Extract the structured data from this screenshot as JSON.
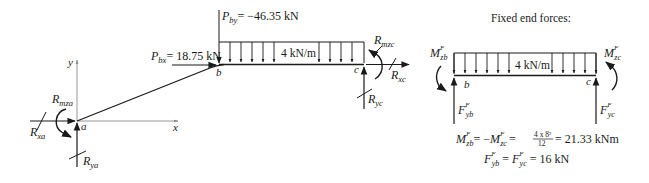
{
  "colors": {
    "ink": "#1a1a1a",
    "axis": "#8a8a8a",
    "background": "#ffffff"
  },
  "left_diagram": {
    "axis_labels": {
      "y": "y",
      "x": "x"
    },
    "nodes": {
      "a": "a",
      "b": "b",
      "c": "c"
    },
    "loads": {
      "pbx": {
        "symbol": "P",
        "sub": "bx",
        "value": "= 18.75 kN"
      },
      "pby": {
        "symbol": "P",
        "sub": "by",
        "value": "= −46.35 kN"
      },
      "udl": "4 kN/m"
    },
    "reactions": {
      "rmza": {
        "symbol": "R",
        "sub": "mza"
      },
      "rxa": {
        "symbol": "R",
        "sub": "xa"
      },
      "rya": {
        "symbol": "R",
        "sub": "ya"
      },
      "rmzc": {
        "symbol": "R",
        "sub": "mzc"
      },
      "rxc": {
        "symbol": "R",
        "sub": "xc"
      },
      "ryc": {
        "symbol": "R",
        "sub": "yc"
      }
    }
  },
  "right_diagram": {
    "title": "Fixed end forces:",
    "udl": "4 kN/m",
    "nodes": {
      "b": "b",
      "c": "c"
    },
    "moments": {
      "mzb": {
        "symbol": "M",
        "sup": "F",
        "sub": "zb"
      },
      "mzc": {
        "symbol": "M",
        "sup": "F",
        "sub": "zc"
      }
    },
    "forces": {
      "fyb": {
        "symbol": "F",
        "sup": "F",
        "sub": "yb"
      },
      "fyc": {
        "symbol": "F",
        "sup": "F",
        "sub": "yc"
      }
    },
    "equations": {
      "moment_eq": {
        "lhs_a": {
          "symbol": "M",
          "sup": "F",
          "sub": "zb"
        },
        "eq1": "= −",
        "lhs_b": {
          "symbol": "M",
          "sup": "F",
          "sub": "zc"
        },
        "eq2": "=",
        "frac_num": "4 x 8²",
        "frac_den": "12",
        "result": "= 21.33 kNm"
      },
      "force_eq": {
        "lhs_a": {
          "symbol": "F",
          "sup": "F",
          "sub": "yb"
        },
        "eq1": "=",
        "lhs_b": {
          "symbol": "F",
          "sup": "F",
          "sub": "yc"
        },
        "result": "= 16 kN"
      }
    }
  }
}
